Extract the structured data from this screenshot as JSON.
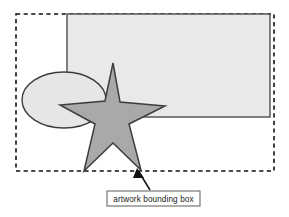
{
  "figure": {
    "background_color": "#ffffff",
    "width": 289,
    "height": 217
  },
  "bounding_box": {
    "name": "artwork bounding box",
    "style": "dashed",
    "stroke_color": "#111111",
    "fill": "none",
    "x": 16,
    "y": 14,
    "width": 258,
    "height": 157
  },
  "shapes": [
    {
      "id": "rectangle",
      "type": "rect",
      "fill_color": "#e9e9e9",
      "stroke_color": "#4d4d4d",
      "x": 67,
      "y": 14,
      "width": 203,
      "height": 103
    },
    {
      "id": "ellipse",
      "type": "ellipse",
      "fill_color": "#e6e6e6",
      "stroke_color": "#3d3d3d",
      "cx": 64,
      "cy": 100,
      "rx": 42,
      "ry": 28
    },
    {
      "id": "star",
      "type": "star",
      "points": 5,
      "fill_color": "#a9a9a9",
      "stroke_color": "#3d3d3d",
      "cx": 113,
      "cy": 119,
      "outer_radius": 56,
      "inner_radius": 23
    }
  ],
  "callout": {
    "label": "artwork bounding box",
    "box_x": 107,
    "box_y": 191,
    "box_width": 93,
    "box_height": 15,
    "box_fill": "#ffffff",
    "box_stroke": "#6b6b6b",
    "leader_from_x": 150,
    "leader_from_y": 190,
    "leader_to_x": 137,
    "leader_to_y": 169,
    "leader_color": "#111111"
  }
}
